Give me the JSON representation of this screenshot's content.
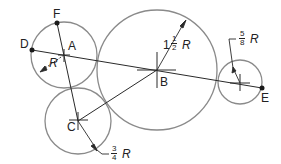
{
  "diagram": {
    "colors": {
      "circle": "#8a8a8a",
      "line": "#2a2a2a",
      "text": "#222222"
    },
    "points": [
      {
        "id": "A",
        "label": "A"
      },
      {
        "id": "B",
        "label": "B"
      },
      {
        "id": "C",
        "label": "C"
      },
      {
        "id": "D",
        "label": "D"
      },
      {
        "id": "E",
        "label": "E"
      },
      {
        "id": "F",
        "label": "F"
      }
    ],
    "dimensions": {
      "circle_a": {
        "value": "R",
        "text": "R"
      },
      "circle_b": {
        "whole": "1",
        "num": "1",
        "den": "2",
        "unit": "R"
      },
      "circle_c": {
        "num": "3",
        "den": "4",
        "unit": "R"
      },
      "circle_e": {
        "num": "5",
        "den": "8",
        "unit": "R"
      }
    }
  }
}
